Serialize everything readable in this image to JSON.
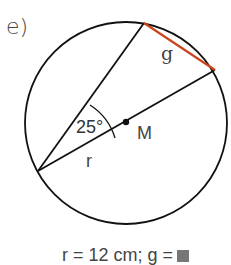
{
  "exercise": {
    "part_label": "e)",
    "given_text": "r = 12 cm; g =",
    "unknown_marker": "blank-box"
  },
  "diagram": {
    "center_label": "M",
    "radius_label": "r",
    "chord_label": "g",
    "angle_label": "25°",
    "angle_degrees": 25,
    "colors": {
      "lines": "#111111",
      "chord_highlight": "#c8461e",
      "text": "#444444"
    }
  }
}
